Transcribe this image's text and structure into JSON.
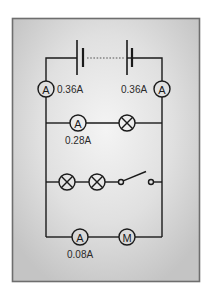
{
  "diagram": {
    "type": "circuit",
    "colors": {
      "frame_border": "#6e6e6e",
      "panel_edge": "#c6c6c6",
      "panel_center": "#f4f4f4",
      "wire": "#1a1a1a"
    },
    "battery": {
      "label": "battery of cells",
      "cells_shown": 2,
      "gap_style": "dotted"
    },
    "main_ammeters": [
      {
        "id": "A-left",
        "symbol": "A",
        "reading": "0.36A"
      },
      {
        "id": "A-right",
        "symbol": "A",
        "reading": "0.36A"
      }
    ],
    "branches": [
      {
        "id": "branch-1",
        "components": [
          {
            "type": "ammeter",
            "symbol": "A",
            "reading": "0.28A"
          },
          {
            "type": "lamp"
          }
        ]
      },
      {
        "id": "branch-2",
        "components": [
          {
            "type": "lamp"
          },
          {
            "type": "lamp"
          },
          {
            "type": "switch",
            "state": "open"
          }
        ]
      },
      {
        "id": "branch-3",
        "components": [
          {
            "type": "ammeter",
            "symbol": "A",
            "reading": "0.08A"
          },
          {
            "type": "motor",
            "symbol": "M"
          }
        ]
      }
    ]
  }
}
